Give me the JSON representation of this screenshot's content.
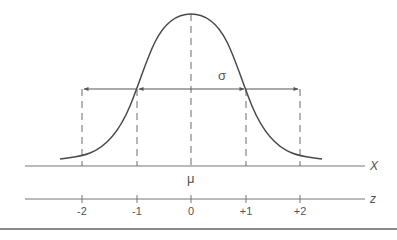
{
  "diagram": {
    "colors": {
      "curve": "#4a4a4a",
      "axis": "#777777",
      "dash": "#6a6a6a",
      "arrow": "#555555",
      "text": "#555555",
      "rule": "#888888"
    },
    "labels": {
      "sigma": "σ",
      "mu": "μ",
      "x_axis": "X",
      "z_axis": "z"
    },
    "z_ticks": [
      {
        "label": "-2",
        "value": -2
      },
      {
        "label": "-1",
        "value": -1
      },
      {
        "label": "0",
        "value": 0
      },
      {
        "label": "+1",
        "value": 1
      },
      {
        "label": "+2",
        "value": 2
      }
    ],
    "annotations": {
      "arrow_one_sd": "arrows spanning μ to μ±1σ",
      "arrow_two_sd": "arrows spanning μ±1σ to μ±2σ"
    }
  }
}
